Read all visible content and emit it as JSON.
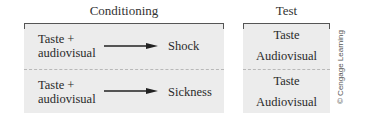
{
  "headings": {
    "conditioning": "Conditioning",
    "test": "Test"
  },
  "conditioning_rows": [
    {
      "cs_line1": "Taste +",
      "cs_line2": "audiovisual",
      "us": "Shock"
    },
    {
      "cs_line1": "Taste +",
      "cs_line2": "audiovisual",
      "us": "Sickness"
    }
  ],
  "test_rows": [
    {
      "line1": "Taste",
      "line2": "Audiovisual"
    },
    {
      "line1": "Taste",
      "line2": "Audiovisual"
    }
  ],
  "credit": "© Cengage Learning",
  "colors": {
    "panel": "#ececec",
    "line": "#555555",
    "divider": "#b8b8b8"
  }
}
